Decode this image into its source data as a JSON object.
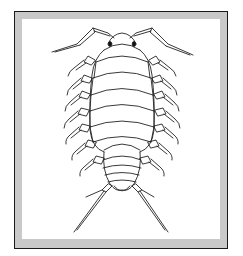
{
  "image": {
    "subject": "Isopod (woodlouse) line drawing, dorsal view",
    "alt": "Black-and-white line illustration of an isopod with antennae, seven pairs of legs, segmented body and tail uropods, inside a gray framed border"
  },
  "colors": {
    "background": "#ffffff",
    "frame_outer_line": "#1a1a1a",
    "frame_band": "#c9c9c9",
    "inner_panel": "#ffffff",
    "ink": "#222222"
  },
  "illustration": {
    "body_segments": 7,
    "tail_segments": 5,
    "leg_pairs": 7,
    "antennae": 2,
    "uropods": 2
  }
}
